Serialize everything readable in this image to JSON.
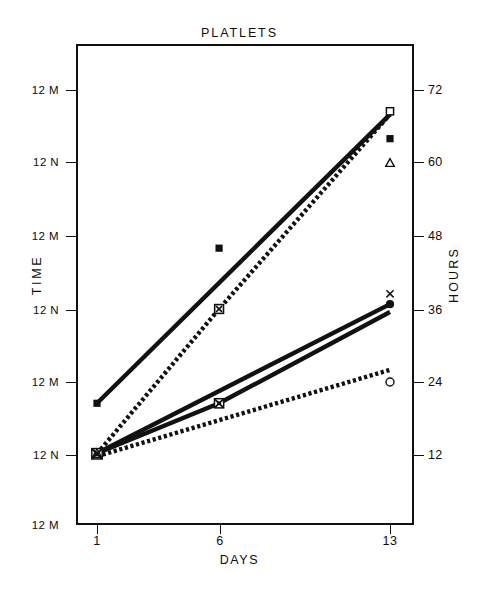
{
  "chart_data": {
    "type": "line",
    "title": "PLATLETS",
    "xlabel": "DAYS",
    "ylabel": "TIME",
    "ylabel_right": "HOURS",
    "grid": false,
    "legend": "none",
    "x": [
      1,
      6,
      13
    ],
    "x_tick_labels": [
      "1",
      "6",
      "13"
    ],
    "xlim": [
      0,
      14.6
    ],
    "ylim_hours": [
      0,
      78
    ],
    "y_tick_labels_left": [
      "12 M",
      "12 N",
      "12 M",
      "12 N",
      "12 M",
      "12 N",
      "12 M"
    ],
    "y_tick_hours_left": [
      72,
      60,
      48,
      36,
      24,
      12,
      0
    ],
    "y_tick_labels_right": [
      "72",
      "60",
      "48",
      "36",
      "24",
      "12"
    ],
    "y_tick_hours_right": [
      72,
      60,
      48,
      36,
      24,
      12
    ],
    "series": [
      {
        "name": "solid-steep",
        "style": "solid",
        "marker": "filled-square",
        "x": [
          1,
          13
        ],
        "values": [
          20.5,
          68.0
        ]
      },
      {
        "name": "dotted-steep",
        "style": "dotted",
        "marker": "open-square",
        "x": [
          1,
          6,
          13
        ],
        "values": [
          12.2,
          36.0,
          68.0
        ]
      },
      {
        "name": "solid-upper-medium",
        "style": "solid",
        "marker": "filled-circle",
        "x": [
          1,
          13
        ],
        "values": [
          12.3,
          36.8
        ]
      },
      {
        "name": "solid-lower-medium",
        "style": "solid",
        "marker": "cross",
        "x": [
          1,
          6,
          13
        ],
        "values": [
          12.3,
          20.5,
          35.5
        ]
      },
      {
        "name": "dotted-shallow",
        "style": "dotted",
        "marker": "open-circle",
        "x": [
          1,
          13
        ],
        "values": [
          11.8,
          26.0
        ]
      }
    ],
    "markers": [
      {
        "name": "day1-filled-square",
        "shape": "filled-square",
        "x": 1,
        "hours": 20.5
      },
      {
        "name": "day1-cluster",
        "shape": "cluster",
        "x": 1,
        "hours": 12.2
      },
      {
        "name": "day6-filled-square",
        "shape": "filled-square",
        "x": 6,
        "hours": 46.0
      },
      {
        "name": "day6-open-square-cross",
        "shape": "open-square-cross",
        "x": 6,
        "hours": 36.0
      },
      {
        "name": "day6-cross-cluster",
        "shape": "cross-cluster",
        "x": 6,
        "hours": 20.5
      },
      {
        "name": "day13-open-square",
        "shape": "open-square",
        "x": 13,
        "hours": 68.5
      },
      {
        "name": "day13-filled-square",
        "shape": "filled-square",
        "x": 13,
        "hours": 64.0
      },
      {
        "name": "day13-open-triangle",
        "shape": "open-triangle",
        "x": 13,
        "hours": 60.0
      },
      {
        "name": "day13-cross",
        "shape": "cross",
        "x": 13,
        "hours": 38.5
      },
      {
        "name": "day13-filled-circle",
        "shape": "filled-circle",
        "x": 13,
        "hours": 36.8
      },
      {
        "name": "day13-open-circle",
        "shape": "open-circle",
        "x": 13,
        "hours": 24.0
      }
    ],
    "colors": {
      "ink": "#111111",
      "background": "#ffffff"
    }
  },
  "axes": {
    "left": {
      "title": "TIME",
      "ticks": [
        {
          "label": "12 M",
          "y": 90
        },
        {
          "label": "12 N",
          "y": 162
        },
        {
          "label": "12 M",
          "y": 236
        },
        {
          "label": "12 N",
          "y": 310
        },
        {
          "label": "12 M",
          "y": 382
        },
        {
          "label": "12 N",
          "y": 455
        },
        {
          "label": "12 M",
          "y": 525
        }
      ]
    },
    "right": {
      "title": "HOURS",
      "ticks": [
        {
          "label": "72",
          "y": 90
        },
        {
          "label": "60",
          "y": 162
        },
        {
          "label": "48",
          "y": 236
        },
        {
          "label": "36",
          "y": 310
        },
        {
          "label": "24",
          "y": 382
        },
        {
          "label": "12",
          "y": 455
        }
      ]
    },
    "bottom": {
      "title": "DAYS",
      "ticks": [
        {
          "label": "1",
          "x": 97
        },
        {
          "label": "6",
          "x": 220
        },
        {
          "label": "13",
          "x": 390
        }
      ]
    }
  }
}
